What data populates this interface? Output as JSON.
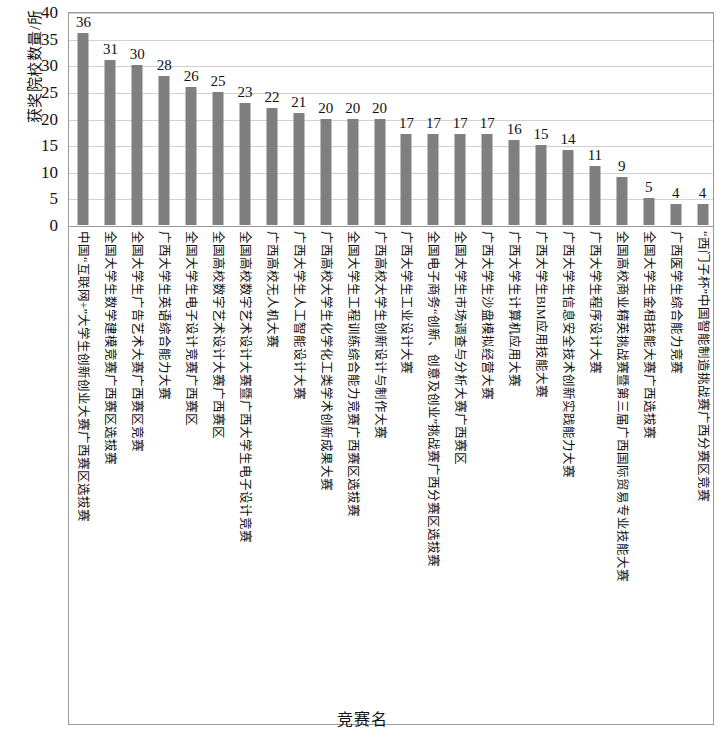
{
  "chart_data": {
    "type": "bar",
    "title": "",
    "xlabel": "竞赛名",
    "ylabel": "获奖院校数量/所",
    "ylim": [
      0,
      40
    ],
    "yticks": [
      0,
      5,
      10,
      15,
      20,
      25,
      30,
      35,
      40
    ],
    "grid": true,
    "legend": false,
    "bar_color": "#7f7f7f",
    "categories": [
      "中国“互联网+”大学生创新创业大赛广西赛区选拔赛",
      "全国大学生数学建模竞赛广西赛区选拔赛",
      "全国大学生广告艺术大赛广西赛区竞赛",
      "广西大学生英语综合能力大赛",
      "全国大学生电子设计竞赛广西赛区",
      "全国高校数字艺术设计大赛广西赛区",
      "全国高校数字艺术设计大赛暨广西大学生电子设计竞赛",
      "广西高校无人机大赛",
      "广西大学生人工智能设计大赛",
      "广西高校大学生化学化工类学术创新成果大赛",
      "全国大学生工程训练综合能力竞赛广西赛区选拔赛",
      "广西高校大学生创新设计与制作大赛",
      "广西大学生工业设计大赛",
      "全国电子商务“创新、创意及创业”挑战赛广西分赛区选拔赛",
      "全国大学生市场调查与分析大赛广西赛区",
      "广西大学生沙盘模拟经营大赛",
      "广西大学生计算机应用大赛",
      "广西大学生BIM应用技能大赛",
      "广西大学生信息安全技术创新实践能力大赛",
      "广西大学生程序设计大赛",
      "全国高校商业精英挑战赛暨第三届广西国际贸易专业技能大赛",
      "全国大学生金相技能大赛广西选拔赛",
      "广西医学生综合能力竞赛",
      "“西门子杯”中国智能制造挑战赛广西分赛区竞赛"
    ],
    "values": [
      36,
      31,
      30,
      28,
      26,
      25,
      23,
      22,
      21,
      20,
      20,
      20,
      17,
      17,
      17,
      17,
      16,
      15,
      14,
      11,
      9,
      5,
      4,
      4
    ],
    "value_labels": [
      "36",
      "31",
      "30",
      "28",
      "26",
      "25",
      "23",
      "22",
      "21",
      "20",
      "20",
      "20",
      "17",
      "17",
      "17",
      "17",
      "16",
      "15",
      "14",
      "11",
      "9",
      "5",
      "4",
      "4"
    ],
    "ytick_labels": [
      "0",
      "5",
      "10",
      "15",
      "20",
      "25",
      "30",
      "35",
      "40"
    ]
  }
}
